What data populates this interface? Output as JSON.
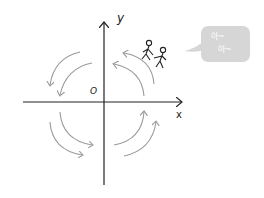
{
  "diagram": {
    "axes": {
      "x_label": "x",
      "y_label": "y",
      "origin_label": "O"
    },
    "rotation_direction": "counter-clockwise",
    "arrows": {
      "color": "#9a9a9a",
      "count": 8
    },
    "speech_bubble": {
      "line1": "아~",
      "line2": "아~",
      "background": "#d6d6d6",
      "text_color": "#ffffff"
    },
    "figures": "two stick figures holding hands, riding the arc"
  }
}
